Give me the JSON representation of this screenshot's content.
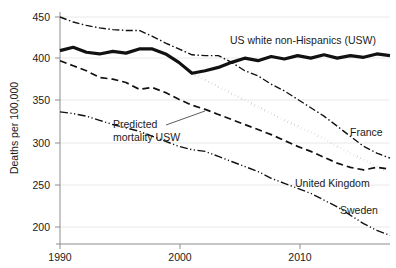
{
  "chart_data": {
    "type": "line",
    "title": "",
    "xlabel": "",
    "ylabel": "Deaths per 100,000",
    "xlim": [
      1990,
      2015
    ],
    "ylim": [
      180,
      455
    ],
    "grid": true,
    "legend_position": "inline-labels",
    "x_ticks": [
      1990,
      2000,
      2010
    ],
    "x_tick_labels": [
      "1990",
      "2000",
      "2010"
    ],
    "y_ticks": [
      200,
      250,
      300,
      350,
      400,
      450
    ],
    "y_tick_labels": [
      "200",
      "250",
      "300",
      "350",
      "400",
      "450"
    ],
    "x": [
      1990,
      1991,
      1992,
      1993,
      1994,
      1995,
      1996,
      1997,
      1998,
      1999,
      2000,
      2001,
      2002,
      2003,
      2004,
      2005,
      2006,
      2007,
      2008,
      2009,
      2010,
      2011,
      2012,
      2013,
      2014,
      2015
    ],
    "series": [
      {
        "name": "US white non-Hispanics (USW)",
        "label": "US white non-Hispanics (USW)",
        "style": "solid-bold",
        "color": "#111111",
        "values": [
          410,
          414,
          408,
          406,
          409,
          407,
          412,
          412,
          406,
          396,
          383,
          386,
          390,
          396,
          401,
          398,
          403,
          400,
          404,
          401,
          405,
          401,
          404,
          402,
          406,
          404
        ]
      },
      {
        "name": "France",
        "label": "France",
        "style": "dash-dot",
        "color": "#111111",
        "values": [
          450,
          444,
          440,
          437,
          435,
          434,
          434,
          427,
          419,
          412,
          405,
          404,
          404,
          396,
          386,
          380,
          370,
          362,
          352,
          342,
          332,
          320,
          308,
          296,
          288,
          282
        ]
      },
      {
        "name": "United Kingdom",
        "label": "United Kingdom",
        "style": "dashed",
        "color": "#111111",
        "values": [
          398,
          392,
          386,
          378,
          376,
          372,
          364,
          366,
          360,
          352,
          345,
          340,
          334,
          328,
          322,
          316,
          310,
          303,
          296,
          290,
          283,
          276,
          271,
          268,
          271,
          269
        ]
      },
      {
        "name": "Sweden",
        "label": "Sweden",
        "style": "dash-dot-dot",
        "color": "#111111",
        "values": [
          337,
          335,
          332,
          327,
          322,
          318,
          314,
          308,
          302,
          296,
          292,
          290,
          284,
          278,
          272,
          266,
          258,
          252,
          246,
          240,
          232,
          224,
          214,
          204,
          196,
          190
        ]
      },
      {
        "name": "Predicted mortality USW",
        "label": "Predicted mortality USW",
        "style": "dotted",
        "color": "#111111",
        "values": [
          null,
          null,
          null,
          null,
          null,
          null,
          null,
          null,
          null,
          null,
          383,
          375,
          367,
          359,
          351,
          343,
          335,
          327,
          320,
          313,
          305,
          296,
          288,
          280,
          272,
          264
        ]
      }
    ],
    "annotations": [
      {
        "name": "predicted-mortality-annotation",
        "text_line1": "Predicted",
        "text_line2": "mortality USW",
        "points_to_series": "Predicted mortality USW"
      }
    ]
  },
  "labels": {
    "usw": "US white non-Hispanics (USW)",
    "france": "France",
    "united_kingdom": "United Kingdom",
    "sweden": "Sweden",
    "predicted_line1": "Predicted",
    "predicted_line2": "mortality USW",
    "y_axis_title": "Deaths per 100,000",
    "y450": "450",
    "y400": "400",
    "y350": "350",
    "y300": "300",
    "y250": "250",
    "y200": "200",
    "x1990": "1990",
    "x2000": "2000",
    "x2010": "2010"
  },
  "colors": {
    "line": "#111111",
    "grid": "#e2e2e2",
    "axis": "#8d8d8d",
    "text": "#1a1a1a",
    "background": "#ffffff"
  }
}
